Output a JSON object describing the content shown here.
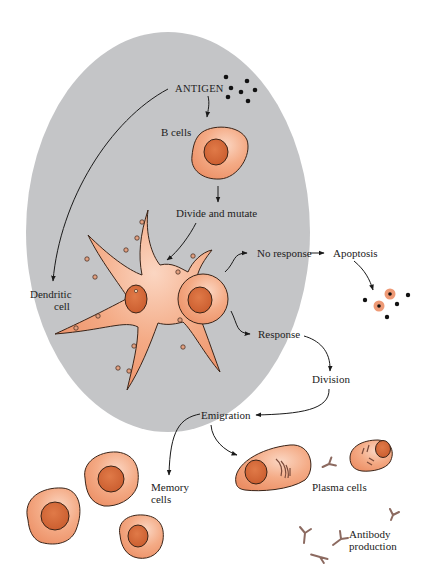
{
  "diagram": {
    "type": "biological process flow",
    "colors": {
      "background": "#ffffff",
      "node_region": "#c4c5c7",
      "cell_fill": "#f0a07c",
      "cell_light": "#f8c9b0",
      "nucleus": "#d86b3c",
      "outline": "#3a2418",
      "arrow": "#1a1a1a",
      "antibody": "#a0756a"
    },
    "labels": {
      "antigen": "ANTIGEN",
      "b_cells": "B cells",
      "divide_mutate": "Divide and mutate",
      "dendritic_1": "Dendritic",
      "dendritic_2": "cell",
      "no_response": "No response",
      "apoptosis": "Apoptosis",
      "response": "Response",
      "division": "Division",
      "emigration": "Emigration",
      "memory_1": "Memory",
      "memory_2": "cells",
      "plasma": "Plasma cells",
      "antibody_1": "Antibody",
      "antibody_2": "production"
    },
    "flow": [
      {
        "from": "ANTIGEN",
        "to": "B cells"
      },
      {
        "from": "ANTIGEN",
        "to": "Dendritic cell"
      },
      {
        "from": "B cells",
        "to": "Divide and mutate"
      },
      {
        "from": "Divide and mutate",
        "to": "Dendritic cell"
      },
      {
        "from": "B cell on dendritic cell",
        "to": "No response"
      },
      {
        "from": "No response",
        "to": "Apoptosis"
      },
      {
        "from": "B cell on dendritic cell",
        "to": "Response"
      },
      {
        "from": "Response",
        "to": "Division"
      },
      {
        "from": "Division",
        "to": "Emigration"
      },
      {
        "from": "Emigration",
        "to": "Memory cells"
      },
      {
        "from": "Emigration",
        "to": "Plasma cells"
      },
      {
        "from": "Plasma cells",
        "to": "Antibody production"
      }
    ]
  }
}
